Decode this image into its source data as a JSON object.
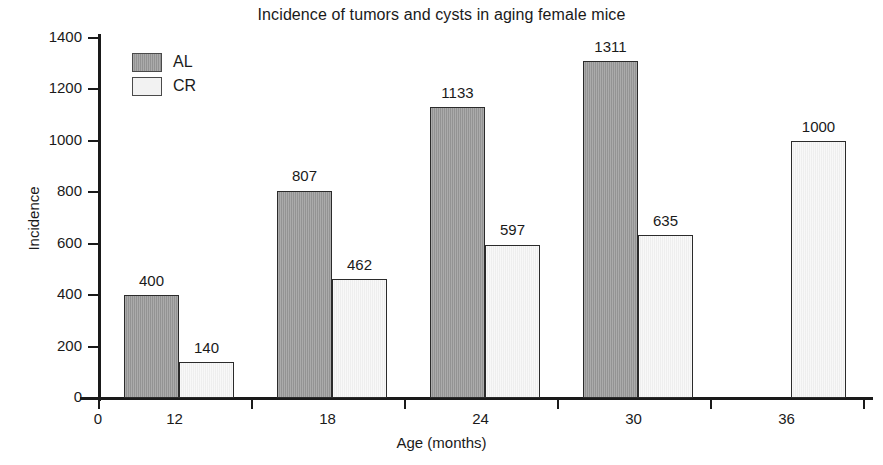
{
  "chart_data": {
    "type": "bar",
    "title": "Incidence of tumors and cysts in aging female mice",
    "xlabel": "Age (months)",
    "ylabel": "Incidence",
    "categories": [
      "12",
      "18",
      "24",
      "30",
      "36"
    ],
    "series": [
      {
        "name": "AL",
        "color": "#9b9b9b",
        "values": [
          400,
          807,
          1133,
          1311,
          null
        ]
      },
      {
        "name": "CR",
        "color": "#f1f1f1",
        "values": [
          140,
          462,
          597,
          635,
          1000
        ]
      }
    ],
    "ylim": [
      0,
      1400
    ],
    "yticks": [
      0,
      200,
      400,
      600,
      800,
      1000,
      1200,
      1400
    ],
    "ytick_labels": [
      "0",
      "200",
      "400",
      "600",
      "800",
      "1000",
      "1200",
      "1400"
    ],
    "xtick_labels": [
      "0",
      "12",
      "18",
      "24",
      "30",
      "36"
    ],
    "xaxis_origin_label": "0",
    "grid": false,
    "legend_position": "upper-left",
    "data_labels": [
      "400",
      "140",
      "807",
      "462",
      "1133",
      "597",
      "1311",
      "635",
      "1000"
    ]
  },
  "legend": {
    "items": [
      {
        "label": "AL",
        "swatch": "al"
      },
      {
        "label": "CR",
        "swatch": "cr"
      }
    ]
  }
}
